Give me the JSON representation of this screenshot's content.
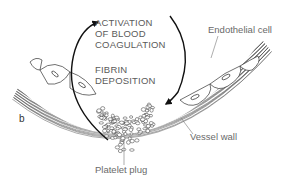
{
  "diagram": {
    "panel_label": "b",
    "process_text": {
      "line1": "ACTIVATION",
      "line2": "OF BLOOD",
      "line3": "COAGULATION",
      "line4": "FIBRIN",
      "line5": "DEPOSITION"
    },
    "labels": {
      "endothelial_cell": "Endothelial cell",
      "vessel_wall": "Vessel wall",
      "platelet_plug": "Platelet plug"
    }
  }
}
